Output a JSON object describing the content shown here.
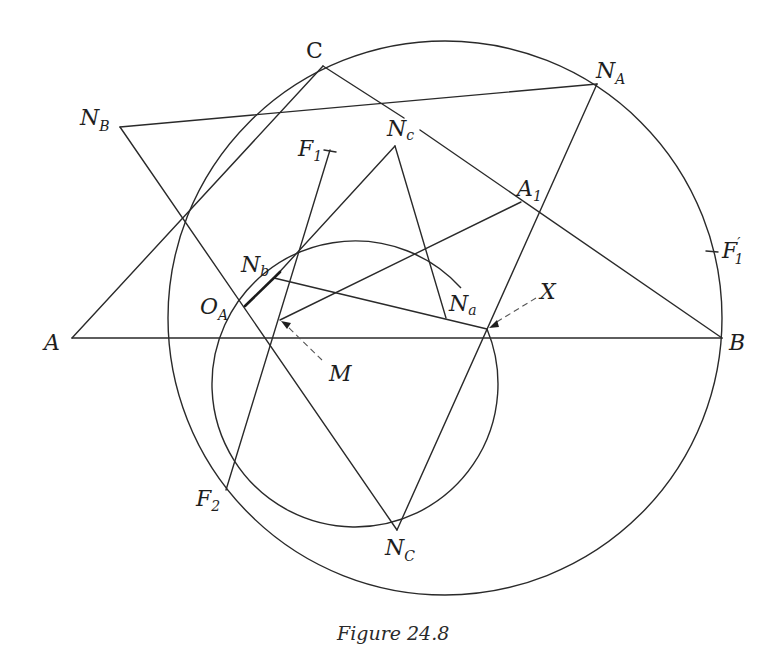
{
  "figure": {
    "caption": "Figure 24.8"
  },
  "labels": {
    "A": {
      "main": "A",
      "sub": ""
    },
    "B": {
      "main": "B",
      "sub": ""
    },
    "C": {
      "main": "C",
      "sub": ""
    },
    "NA": {
      "main": "N",
      "sub": "A"
    },
    "NB": {
      "main": "N",
      "sub": "B"
    },
    "NC": {
      "main": "N",
      "sub": "C"
    },
    "Na": {
      "main": "N",
      "sub": "a"
    },
    "Nb": {
      "main": "N",
      "sub": "b"
    },
    "Nc": {
      "main": "N",
      "sub": "c"
    },
    "A1": {
      "main": "A",
      "sub": "1"
    },
    "F1": {
      "main": "F",
      "sub": "1"
    },
    "F2": {
      "main": "F",
      "sub": "2"
    },
    "F1p": {
      "main": "F",
      "sub": "1",
      "prime": "′"
    },
    "OA": {
      "main": "O",
      "sub": "A"
    },
    "M": {
      "main": "M",
      "sub": ""
    },
    "X": {
      "main": "X",
      "sub": ""
    }
  },
  "points": {
    "A": [
      72,
      338
    ],
    "B": [
      722,
      338
    ],
    "C": [
      323,
      66
    ],
    "N_A": [
      597,
      84
    ],
    "N_B": [
      120,
      127
    ],
    "N_C": [
      397,
      530
    ],
    "N_a": [
      446,
      318
    ],
    "N_b": [
      274,
      278
    ],
    "N_c": [
      395,
      146
    ],
    "A_1": [
      521,
      202
    ],
    "F_1": [
      330,
      150
    ],
    "F_2": [
      226,
      490
    ],
    "F_1_prime": [
      712,
      251
    ],
    "O_A": [
      245,
      306
    ],
    "M": [
      280,
      320
    ],
    "X": [
      487,
      329
    ]
  },
  "circles": {
    "circumcircle": {
      "cx": 445,
      "cy": 318,
      "r": 277
    },
    "small_circle": {
      "cx": 360,
      "cy": 392,
      "r": 143
    }
  }
}
